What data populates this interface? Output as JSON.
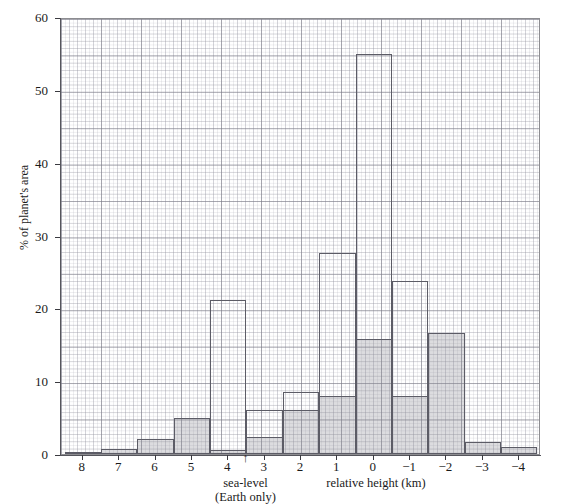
{
  "chart_data": {
    "type": "bar",
    "title": "",
    "xlabel": "relative height (km)",
    "ylabel": "% of planet's area",
    "xlim": [
      8.6,
      -4.6
    ],
    "ylim": [
      0,
      60
    ],
    "x_tick_labels": [
      "8",
      "7",
      "6",
      "5",
      "4",
      "3",
      "2",
      "1",
      "0",
      "−1",
      "−2",
      "−3",
      "−4"
    ],
    "x_tick_values": [
      8,
      7,
      6,
      5,
      4,
      3,
      2,
      1,
      0,
      -1,
      -2,
      -3,
      -4
    ],
    "y_tick_labels": [
      "0",
      "10",
      "20",
      "30",
      "40",
      "50",
      "60"
    ],
    "y_tick_values": [
      0,
      10,
      20,
      30,
      40,
      50,
      60
    ],
    "grid": true,
    "legend": "none",
    "annotations": [
      {
        "text": "sea-level",
        "text2": "(Earth only)",
        "arrow": "↑",
        "x_value": 3.5
      }
    ],
    "categories": [
      8,
      7,
      6,
      5,
      4,
      3,
      2,
      1,
      0,
      -1,
      -2,
      -3,
      -4
    ],
    "series": [
      {
        "name": "outlined",
        "style": "outline",
        "values": [
          0.3,
          0.7,
          2.1,
          5.0,
          21.2,
          6.0,
          8.5,
          27.6,
          54.9,
          23.8,
          16.6,
          1.6,
          1.0
        ]
      },
      {
        "name": "shaded",
        "style": "shaded",
        "values": [
          0.3,
          0.7,
          2.1,
          5.0,
          0.6,
          2.4,
          6.1,
          8.0,
          15.8,
          8.0,
          16.6,
          1.6,
          1.0
        ]
      }
    ]
  },
  "axis": {
    "y_title": "% of planet's area",
    "x_title": "relative height (km)"
  },
  "sealevel": {
    "arrow": "↑",
    "line1": "sea-level",
    "line2": "(Earth only)"
  },
  "colors": {
    "bar_outline": "#5c5c66",
    "bar_fill": "#8a8a94",
    "grid": "#7878849",
    "axis": "#55555c",
    "text": "#1a1a1a"
  }
}
